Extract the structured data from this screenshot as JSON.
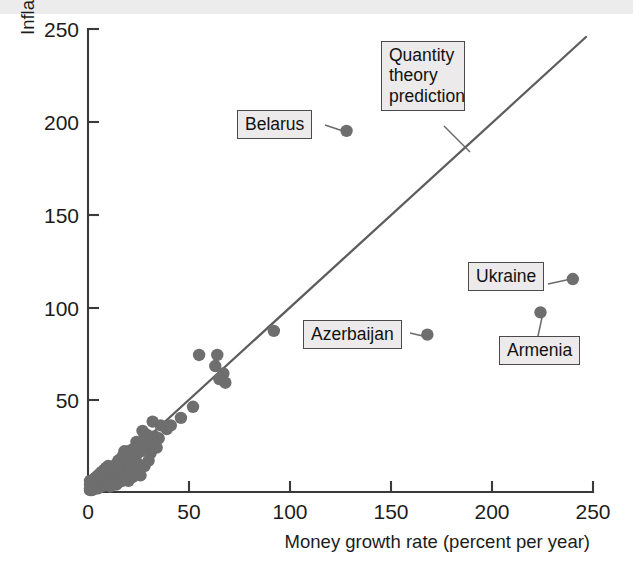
{
  "figure": {
    "background_color": "#ffffff",
    "dot_color": "#6e6e6e",
    "line_color": "#5d5d5d",
    "axis_color": "#3a3a3a",
    "callout_bg": "#eceaea",
    "callout_border": "#4a4a4a"
  },
  "chart_data": {
    "type": "scatter",
    "title": "",
    "xlabel": "Money growth rate (percent per year)",
    "ylabel": "Inflation rate (percent per year)",
    "xlim": [
      0,
      250
    ],
    "ylim": [
      0,
      250
    ],
    "xticks": [
      0,
      50,
      100,
      150,
      200,
      250
    ],
    "yticks": [
      0,
      50,
      100,
      150,
      200,
      250
    ],
    "xticklabels": [
      "0",
      "50",
      "100",
      "150",
      "200",
      "250"
    ],
    "yticklabels": [
      "0",
      "50",
      "100",
      "150",
      "200",
      "250"
    ],
    "grid": false,
    "legend": "none",
    "reference_line": {
      "label": "Quantity theory prediction",
      "type": "identity",
      "slope": 1,
      "intercept": 0,
      "x_start": 0,
      "x_end": 247,
      "y_start": 0,
      "y_end": 247
    },
    "labeled_points": [
      {
        "name": "Belarus",
        "x": 128,
        "y": 195
      },
      {
        "name": "Ukraine",
        "x": 240,
        "y": 115
      },
      {
        "name": "Armenia",
        "x": 224,
        "y": 97
      },
      {
        "name": "Azerbaijan",
        "x": 168,
        "y": 85
      }
    ],
    "points": [
      [
        128,
        195
      ],
      [
        240,
        115
      ],
      [
        224,
        97
      ],
      [
        168,
        85
      ],
      [
        92,
        87
      ],
      [
        67,
        64
      ],
      [
        65,
        61
      ],
      [
        63,
        68
      ],
      [
        68,
        59
      ],
      [
        55,
        74
      ],
      [
        64,
        74
      ],
      [
        52,
        46
      ],
      [
        46,
        40
      ],
      [
        41,
        36
      ],
      [
        39,
        34
      ],
      [
        36,
        36
      ],
      [
        35,
        29
      ],
      [
        34,
        24
      ],
      [
        33,
        30
      ],
      [
        32,
        27
      ],
      [
        31,
        21
      ],
      [
        30,
        26
      ],
      [
        29,
        31
      ],
      [
        28,
        29
      ],
      [
        27,
        24
      ],
      [
        26,
        22
      ],
      [
        25,
        25
      ],
      [
        24,
        20
      ],
      [
        24,
        27
      ],
      [
        23,
        19
      ],
      [
        22,
        23
      ],
      [
        22,
        17
      ],
      [
        21,
        18
      ],
      [
        21,
        14
      ],
      [
        20,
        16
      ],
      [
        20,
        22
      ],
      [
        19,
        13
      ],
      [
        19,
        18
      ],
      [
        18,
        15
      ],
      [
        18,
        11
      ],
      [
        17,
        14
      ],
      [
        17,
        19
      ],
      [
        16,
        12
      ],
      [
        16,
        16
      ],
      [
        15,
        10
      ],
      [
        15,
        13
      ],
      [
        15,
        17
      ],
      [
        14,
        9
      ],
      [
        14,
        12
      ],
      [
        14,
        15
      ],
      [
        13,
        8
      ],
      [
        13,
        11
      ],
      [
        13,
        14
      ],
      [
        12,
        7
      ],
      [
        12,
        10
      ],
      [
        12,
        13
      ],
      [
        11,
        6
      ],
      [
        11,
        9
      ],
      [
        11,
        12
      ],
      [
        10,
        5
      ],
      [
        10,
        8
      ],
      [
        10,
        11
      ],
      [
        10,
        14
      ],
      [
        9,
        4
      ],
      [
        9,
        7
      ],
      [
        9,
        10
      ],
      [
        9,
        13
      ],
      [
        8,
        4
      ],
      [
        8,
        6
      ],
      [
        8,
        9
      ],
      [
        8,
        12
      ],
      [
        7,
        3
      ],
      [
        7,
        5
      ],
      [
        7,
        8
      ],
      [
        7,
        11
      ],
      [
        6,
        3
      ],
      [
        6,
        5
      ],
      [
        6,
        7
      ],
      [
        6,
        10
      ],
      [
        5,
        2
      ],
      [
        5,
        4
      ],
      [
        5,
        6
      ],
      [
        5,
        9
      ],
      [
        4,
        2
      ],
      [
        4,
        4
      ],
      [
        4,
        6
      ],
      [
        4,
        8
      ],
      [
        3,
        2
      ],
      [
        3,
        3
      ],
      [
        3,
        5
      ],
      [
        3,
        7
      ],
      [
        2,
        1
      ],
      [
        2,
        3
      ],
      [
        2,
        5
      ],
      [
        2,
        6
      ],
      [
        1,
        1
      ],
      [
        1,
        2
      ],
      [
        1,
        4
      ],
      [
        1,
        6
      ],
      [
        26,
        9
      ],
      [
        24,
        12
      ],
      [
        22,
        8
      ],
      [
        20,
        6
      ],
      [
        19,
        8
      ],
      [
        17,
        6
      ],
      [
        16,
        7
      ],
      [
        15,
        5
      ],
      [
        14,
        4
      ],
      [
        13,
        5
      ],
      [
        12,
        4
      ],
      [
        11,
        3
      ],
      [
        28,
        14
      ],
      [
        30,
        17
      ],
      [
        25,
        15
      ],
      [
        23,
        13
      ],
      [
        21,
        11
      ],
      [
        18,
        22
      ],
      [
        27,
        33
      ],
      [
        32,
        38
      ]
    ],
    "annotations": [
      {
        "text": "Quantity theory prediction",
        "target": "reference-line"
      },
      {
        "text": "Belarus",
        "target": "point"
      },
      {
        "text": "Ukraine",
        "target": "point"
      },
      {
        "text": "Armenia",
        "target": "point"
      },
      {
        "text": "Azerbaijan",
        "target": "point"
      }
    ]
  },
  "callouts": {
    "quantity_theory": "Quantity\ntheory\nprediction",
    "belarus": "Belarus",
    "ukraine": "Ukraine",
    "armenia": "Armenia",
    "azerbaijan": "Azerbaijan"
  },
  "ticks": {
    "x": [
      "0",
      "50",
      "100",
      "150",
      "200",
      "250"
    ],
    "y": [
      "0",
      "50",
      "100",
      "150",
      "200",
      "250"
    ]
  },
  "axis_titles": {
    "x": "Money growth rate (percent per year)",
    "y": "Inflation rate (percent per year)"
  }
}
